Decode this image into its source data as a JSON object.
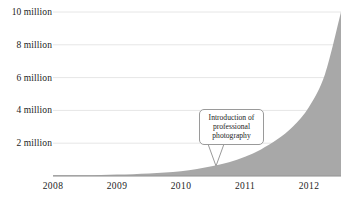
{
  "chart_data": {
    "type": "area",
    "title": "",
    "subtitle": "",
    "xlabel": "",
    "ylabel": "",
    "grid": true,
    "legend": "none",
    "xlim": [
      2008,
      2012.5
    ],
    "ylim": [
      0,
      10000000
    ],
    "x_tick_labels": [
      "2008",
      "2009",
      "2010",
      "2011",
      "2012"
    ],
    "x_tick_values": [
      2008,
      2009,
      2010,
      2011,
      2012
    ],
    "y_tick_labels": [
      "2 million",
      "4 million",
      "6 million",
      "8 million",
      "10 million"
    ],
    "y_tick_values": [
      2000000,
      4000000,
      6000000,
      8000000,
      10000000
    ],
    "series": [
      {
        "name": "cumulative total",
        "fill_color": "#a8a8a8",
        "x": [
          2008.0,
          2008.25,
          2008.5,
          2008.75,
          2009.0,
          2009.25,
          2009.5,
          2009.75,
          2010.0,
          2010.25,
          2010.5,
          2010.75,
          2011.0,
          2011.25,
          2011.5,
          2011.75,
          2012.0,
          2012.25,
          2012.5
        ],
        "values": [
          10000,
          15000,
          25000,
          40000,
          60000,
          90000,
          130000,
          190000,
          270000,
          400000,
          580000,
          820000,
          1150000,
          1600000,
          2200000,
          3000000,
          4200000,
          6200000,
          10000000
        ]
      }
    ],
    "annotations": [
      {
        "text": "Introduction of professional photography",
        "lines": [
          "Introduction of",
          "professional",
          "photography"
        ],
        "pointer_x": 2010.75,
        "pointer_y": 820000
      }
    ]
  },
  "axis": {
    "baseline_color": "#8c8c8c",
    "gridline_color": "#e6e6e6",
    "tick_text_color": "#1c1c1c"
  },
  "annotation": {
    "line1": "Introduction of",
    "line2": "professional",
    "line3": "photography",
    "border_color": "#9a9a9a",
    "background_color": "#ffffff"
  }
}
